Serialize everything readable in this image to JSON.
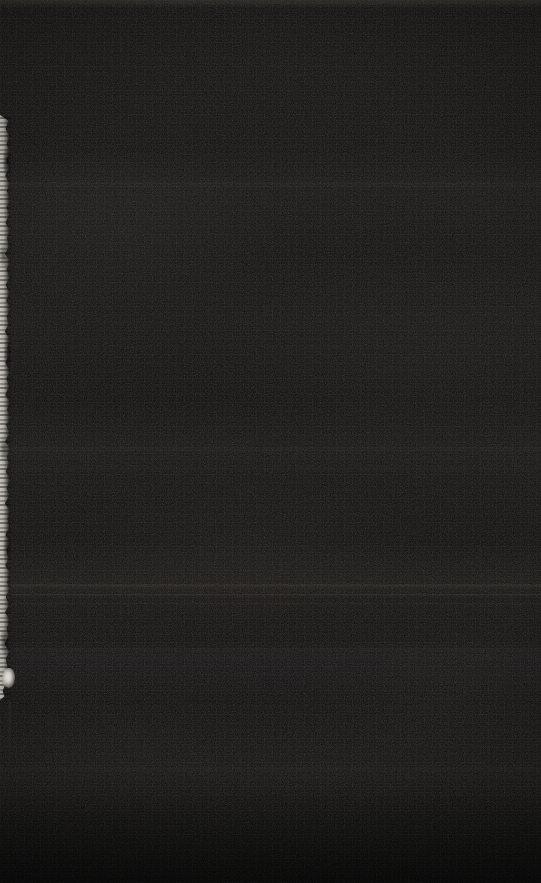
{
  "image": {
    "kind": "photograph",
    "description": "Near-black underexposed photographic frame with no legible subject",
    "width_px": 541,
    "height_px": 883,
    "overall_impression": "Almost entirely black field with heavy compression noise and faint horizontal banding",
    "text_content_present": false,
    "ui_elements_present": false
  },
  "palette": {
    "background_darkest": "#08 0807",
    "background_base": "#0b0a09",
    "background_warm_mid": "#131210",
    "band_highlight": "#2a2722",
    "strip_light": "#d7d4cd",
    "strip_mid": "#968e8b",
    "blob_brightest": "#f5f3ee",
    "vignette": "#000000"
  },
  "features": [
    {
      "name": "left-edge-strip",
      "label": "Torn light strip along left edge",
      "x": 0,
      "y": 115,
      "width": 11,
      "height": 585,
      "note": "Mottled grey-white vertical sliver, ragged contour, brightest element region"
    },
    {
      "name": "bright-blob",
      "label": "Bright highlight blob",
      "x": 2,
      "y": 668,
      "width": 13,
      "height": 20,
      "note": "Single brightest point in the frame, near-white"
    },
    {
      "name": "bottom-left-seam",
      "label": "Faint vertical seam lower-left",
      "x": 9,
      "y": 700,
      "width": 2,
      "height": 183,
      "note": "Very subtle edge continuing below the light strip"
    },
    {
      "name": "top-edge-band",
      "label": "Lighter thin band at top edge",
      "x": 0,
      "y": 0,
      "width": 541,
      "height": 8,
      "note": "Slightly raised luminance across the full width"
    }
  ],
  "horizontal_bands_y": [
    8,
    185,
    320,
    450,
    470,
    588,
    596,
    604,
    650,
    770
  ],
  "notes": {
    "texture": "Heavy JPEG blocking and sensor noise across the entire frame",
    "tint": "Warm dark brown-olive cast",
    "legible_text": "none",
    "legible_icons": "none"
  }
}
